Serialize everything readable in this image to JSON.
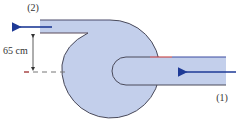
{
  "diagram": {
    "type": "pump-volute-schematic",
    "labels": {
      "outlet": "(2)",
      "inlet": "(1)",
      "dimension": "65 cm"
    },
    "colors": {
      "fluid_fill": "#c3cfeb",
      "outline": "#4a4a5a",
      "flow_arrow": "#1e3a96",
      "dimension_line": "#333333",
      "dashed_line": "#777777",
      "accent_red": "#c03030"
    }
  }
}
